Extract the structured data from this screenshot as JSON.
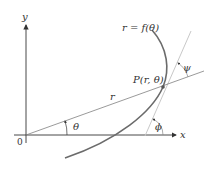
{
  "diagram": {
    "labels": {
      "y_axis": "y",
      "x_axis": "x",
      "origin": "0",
      "curve": "r = f(θ)",
      "point": "P(r, θ)",
      "radius": "r",
      "theta": "θ",
      "psi": "ψ",
      "phi": "ϕ"
    },
    "colors": {
      "axes": "#333333",
      "curve": "#6b6b6b",
      "radial_line": "#808080",
      "tangent_line": "#c8c8c8",
      "text": "#333333"
    }
  }
}
